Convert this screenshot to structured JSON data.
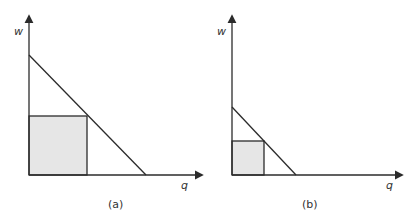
{
  "colors": {
    "line": "#2b2b2b",
    "fill": "#e6e6e6",
    "text": "#333333"
  },
  "panels": [
    {
      "id": "a",
      "label": "(a)",
      "y_axis_label": "w",
      "x_axis_label": "q",
      "origin": [
        29,
        175
      ],
      "y_axis_top": 16,
      "x_axis_right": 202,
      "demand_line": {
        "from": [
          29,
          55
        ],
        "to": [
          146,
          175
        ]
      },
      "shaded_rect": {
        "x": 29,
        "y": 116,
        "w": 58,
        "h": 59
      },
      "y_label_pos": [
        14,
        35
      ],
      "x_label_pos": [
        181,
        189
      ],
      "panel_label_pos": [
        108,
        208
      ]
    },
    {
      "id": "b",
      "label": "(b)",
      "y_axis_label": "w",
      "x_axis_label": "q",
      "origin": [
        232,
        175
      ],
      "y_axis_top": 16,
      "x_axis_right": 402,
      "demand_line": {
        "from": [
          232,
          107
        ],
        "to": [
          296,
          175
        ]
      },
      "shaded_rect": {
        "x": 232,
        "y": 141,
        "w": 32,
        "h": 34
      },
      "y_label_pos": [
        217,
        35
      ],
      "x_label_pos": [
        386,
        189
      ],
      "panel_label_pos": [
        302,
        208
      ]
    }
  ]
}
